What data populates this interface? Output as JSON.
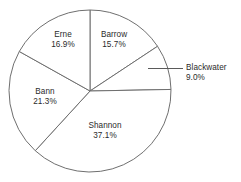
{
  "chart_data": {
    "type": "pie",
    "title": "",
    "subtitle": "",
    "xlabel": "",
    "ylabel": "",
    "legend_position": "none",
    "grid": false,
    "units": "percent",
    "start_angle_deg": 0,
    "direction": "clockwise",
    "categories": [
      "Barrow",
      "Blackwater",
      "Shannon",
      "Bann",
      "Erne"
    ],
    "values": [
      15.7,
      9.0,
      37.1,
      21.3,
      16.9
    ],
    "slices": [
      {
        "label": "Barrow",
        "value_text": "15.7%",
        "value": 15.7,
        "label_placement": "inside",
        "label_x": 114,
        "label_y": 30,
        "start_deg": 0.0,
        "end_deg": 56.5
      },
      {
        "label": "Blackwater",
        "value_text": "9.0%",
        "value": 9.0,
        "label_placement": "outside",
        "label_x": 186,
        "label_y": 63,
        "start_deg": 56.5,
        "end_deg": 88.9,
        "leader": true
      },
      {
        "label": "Shannon",
        "value_text": "37.1%",
        "value": 37.1,
        "label_placement": "inside",
        "label_x": 105,
        "label_y": 121,
        "start_deg": 88.9,
        "end_deg": 222.5
      },
      {
        "label": "Bann",
        "value_text": "21.3%",
        "value": 21.3,
        "label_placement": "inside",
        "label_x": 45,
        "label_y": 87,
        "start_deg": 222.5,
        "end_deg": 299.2
      },
      {
        "label": "Erne",
        "value_text": "16.9%",
        "value": 16.9,
        "label_placement": "inside",
        "label_x": 63,
        "label_y": 30,
        "start_deg": 299.2,
        "end_deg": 360.0
      }
    ],
    "geometry": {
      "center_x": 90,
      "center_y": 91,
      "radius": 81
    },
    "colors": {
      "slice_fill": "#ffffff",
      "slice_stroke": "#6f6f6f",
      "leader_stroke": "#5a5a5a",
      "text": "#2b2b2b",
      "background": "#ffffff"
    }
  }
}
